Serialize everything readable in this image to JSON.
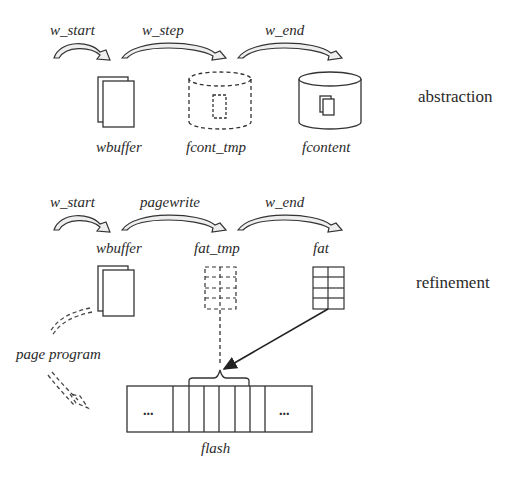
{
  "abstraction": {
    "side_label": "abstraction",
    "transitions": [
      "w_start",
      "w_step",
      "w_end"
    ],
    "states": [
      "wbuffer",
      "fcont_tmp",
      "fcontent"
    ]
  },
  "refinement": {
    "side_label": "refinement",
    "transitions": [
      "w_start",
      "pagewrite",
      "w_end"
    ],
    "states": [
      "wbuffer",
      "fat_tmp",
      "fat"
    ],
    "page_program_label": "page program",
    "flash_label": "flash",
    "flash_ellipsis_left": "...",
    "flash_ellipsis_right": "..."
  }
}
